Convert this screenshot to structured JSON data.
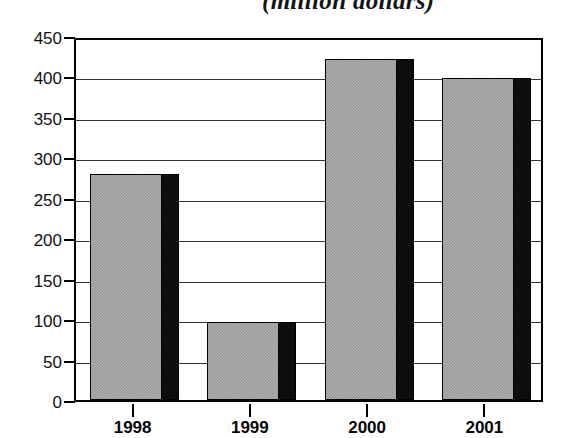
{
  "chart_data": {
    "type": "bar",
    "title": "(million dollars)",
    "xlabel": "",
    "ylabel": "",
    "categories": [
      "1998",
      "1999",
      "2000",
      "2001"
    ],
    "values": [
      280,
      97,
      422,
      398
    ],
    "series": [
      {
        "name": "Amount",
        "values": [
          280,
          97,
          422,
          398
        ]
      }
    ],
    "ylim": [
      0,
      450
    ],
    "y_ticks": [
      0,
      50,
      100,
      150,
      200,
      250,
      300,
      350,
      400,
      450
    ],
    "y_tick_labels": [
      "0",
      "50",
      "100",
      "150",
      "200",
      "250",
      "300",
      "350",
      "400",
      "450"
    ],
    "grid": true,
    "legend": null,
    "legend_position": "none",
    "annotations": [],
    "style": {
      "bar_fill": "#9a9a9a",
      "bar_shadow": "#0d0d0d",
      "bar_outline": "#000000",
      "gridline_color": "#333333",
      "axis_color": "#000000",
      "background": "#ffffff",
      "text_color": "#111111"
    }
  }
}
